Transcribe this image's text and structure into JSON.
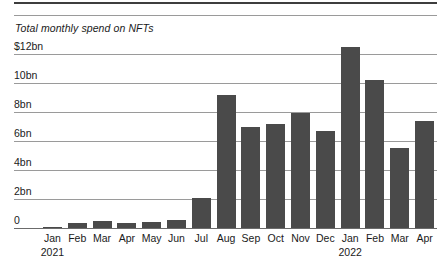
{
  "chart_data": {
    "type": "bar",
    "title": "Total monthly spend on NFTs",
    "xlabel": "",
    "ylabel": "",
    "ylim": [
      0,
      12.5
    ],
    "grid": true,
    "legend": null,
    "categories": [
      "Jan",
      "Feb",
      "Mar",
      "Apr",
      "May",
      "Jun",
      "Jul",
      "Aug",
      "Sep",
      "Oct",
      "Nov",
      "Dec",
      "Jan",
      "Feb",
      "Mar",
      "Apr"
    ],
    "category_years": [
      "2021",
      "",
      "",
      "",
      "",
      "",
      "",
      "",
      "",
      "",
      "",
      "",
      "2022",
      "",
      "",
      ""
    ],
    "values": [
      0.05,
      0.35,
      0.5,
      0.35,
      0.4,
      0.55,
      2.1,
      9.2,
      7.0,
      7.2,
      7.9,
      6.7,
      12.5,
      10.2,
      5.5,
      7.4
    ],
    "ytick_labels": [
      "$12bn",
      "10bn",
      "8bn",
      "6bn",
      "4bn",
      "2bn",
      "0"
    ],
    "ytick_values": [
      12,
      10,
      8,
      6,
      4,
      2,
      0
    ],
    "bar_color": "#4a4a4a",
    "gridline_color": "#9a9a9a",
    "axis_color": "#6b6b6b",
    "rule_color": "#3d3d3d",
    "background": "#ffffff"
  }
}
